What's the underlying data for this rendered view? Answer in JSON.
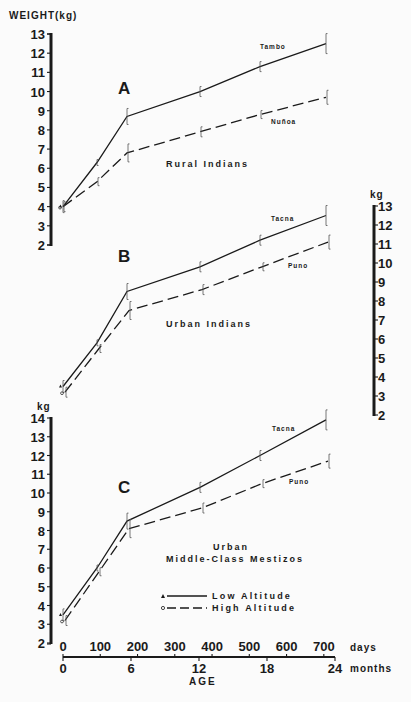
{
  "y_axis_label": "WEIGHT(kg)",
  "kg_label": "kg",
  "x_axis": {
    "days_ticks": [
      "0",
      "100",
      "200",
      "300",
      "400",
      "500",
      "600",
      "700"
    ],
    "days_label": "days",
    "months_ticks": [
      "0",
      "6",
      "12",
      "18",
      "24"
    ],
    "months_label": "months",
    "title": "AGE"
  },
  "axis_ticks": {
    "A_left": [
      "13",
      "12",
      "11",
      "10",
      "9",
      "8",
      "7",
      "6",
      "5",
      "4",
      "3",
      "2"
    ],
    "B_right": [
      "13",
      "12",
      "11",
      "10",
      "9",
      "8",
      "7",
      "6",
      "5",
      "4",
      "3",
      "2"
    ],
    "C_left": [
      "14",
      "13",
      "12",
      "11",
      "10",
      "9",
      "8",
      "7",
      "6",
      "5",
      "4",
      "3",
      "2"
    ]
  },
  "panels": {
    "A": {
      "letter": "A",
      "caption": "Rural Indians",
      "low": "Tambo",
      "high": "Nuñoa"
    },
    "B": {
      "letter": "B",
      "caption": "Urban Indians",
      "low": "Tacna",
      "high": "Puno"
    },
    "C": {
      "letter": "C",
      "caption_line1": "Urban",
      "caption_line2": "Middle-Class Mestizos",
      "low": "Tacna",
      "high": "Puno"
    }
  },
  "legend": {
    "low": "Low Altitude",
    "high": "High Altitude"
  },
  "chart_data": [
    {
      "type": "line",
      "title": "A — Rural Indians",
      "xlabel": "AGE (months)",
      "ylabel": "WEIGHT(kg)",
      "ylim": [
        2,
        13
      ],
      "x": [
        0,
        3,
        6,
        12,
        18,
        24
      ],
      "series": [
        {
          "name": "Tambo (Low Altitude)",
          "style": "solid",
          "values": [
            4.0,
            6.3,
            8.7,
            10.0,
            11.3,
            12.5
          ]
        },
        {
          "name": "Nuñoa (High Altitude)",
          "style": "dashed",
          "values": [
            4.0,
            5.3,
            6.8,
            7.9,
            8.8,
            9.7
          ]
        }
      ]
    },
    {
      "type": "line",
      "title": "B — Urban Indians",
      "xlabel": "AGE (months)",
      "ylabel": "kg",
      "ylim": [
        2,
        13
      ],
      "x": [
        0,
        3,
        6,
        12,
        18,
        24
      ],
      "series": [
        {
          "name": "Tacna (Low Altitude)",
          "style": "solid",
          "values": [
            3.5,
            5.8,
            8.5,
            9.8,
            11.2,
            12.5
          ]
        },
        {
          "name": "Puno (High Altitude)",
          "style": "dashed",
          "values": [
            3.2,
            5.5,
            7.5,
            8.6,
            9.8,
            11.1
          ]
        }
      ]
    },
    {
      "type": "line",
      "title": "C — Urban Middle-Class Mestizos",
      "xlabel": "AGE (months)",
      "ylabel": "kg",
      "ylim": [
        2,
        14
      ],
      "x": [
        0,
        3,
        6,
        12,
        18,
        24
      ],
      "series": [
        {
          "name": "Tacna (Low Altitude)",
          "style": "solid",
          "values": [
            3.5,
            6.0,
            8.5,
            10.3,
            12.0,
            13.9
          ]
        },
        {
          "name": "Puno (High Altitude)",
          "style": "dashed",
          "values": [
            3.2,
            5.8,
            8.1,
            9.2,
            10.5,
            11.7
          ]
        }
      ]
    }
  ]
}
